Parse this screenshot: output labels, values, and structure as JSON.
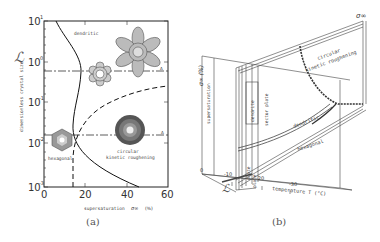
{
  "panel_a": {
    "caption": "(a)",
    "y_axis": {
      "symbol": "ℒ",
      "label": "dimensionless crystal size",
      "ticks": [
        {
          "base": "10",
          "exp": "1"
        },
        {
          "base": "10",
          "exp": "0"
        },
        {
          "base": "10",
          "exp": "-1"
        },
        {
          "base": "10",
          "exp": "-2"
        },
        {
          "base": "10",
          "exp": "-3"
        }
      ]
    },
    "x_axis": {
      "label": "supersaturation",
      "symbol": "σ∞",
      "unit": "(%)",
      "ticks": [
        "0",
        "20",
        "40",
        "60"
      ]
    },
    "regions": {
      "dendritic": "dendritic",
      "hexagonal": "hexagonal",
      "circular_1": "circular",
      "circular_2": "kinetic roughening"
    }
  },
  "panel_b": {
    "caption": "(b)",
    "axis_sigma": "σ∞ (%)",
    "axis_sigma_label": "supersaturation",
    "axis_L": "ℒ",
    "axis_T_label": "temperature  T (°C)",
    "axis_sigma_top": "σ∞",
    "t_ticks": [
      "0",
      "-10",
      "-20",
      "-30"
    ],
    "regions": {
      "dendrite": "dendrite",
      "sector_plate": "sector plate",
      "dendritic": "dendritic",
      "hexagonal": "hexagonal",
      "plate_1": "plate",
      "plate_2": "plate",
      "circular_1": "circular",
      "circular_2": "kinetic roughening"
    }
  }
}
